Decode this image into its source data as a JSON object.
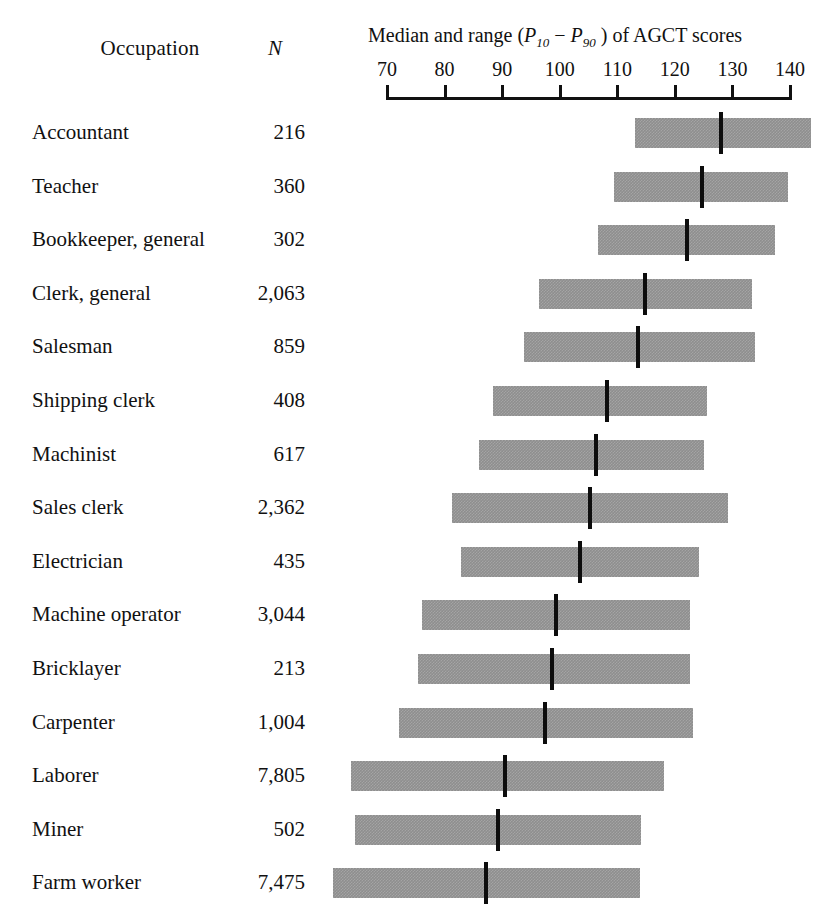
{
  "header": {
    "occupation_label": "Occupation",
    "n_label": "N",
    "axis_title_prefix": "Median and range (",
    "axis_title_p10": "P",
    "axis_title_p10_sub": "10",
    "axis_title_dash": " − ",
    "axis_title_p90": "P",
    "axis_title_p90_sub": "90",
    "axis_title_suffix": " ) of AGCT scores",
    "axis_title_full": "Median and range (P10 − P90 ) of AGCT scores"
  },
  "chart_data": {
    "type": "bar",
    "title": "Median and range (P10 − P90 ) of AGCT scores",
    "xlabel": "AGCT score",
    "ylabel": "Occupation",
    "xlim": [
      70,
      140
    ],
    "xticks": [
      70,
      80,
      90,
      100,
      110,
      120,
      130,
      140
    ],
    "grid": false,
    "legend": null,
    "columns": [
      "Occupation",
      "N",
      "P10",
      "Median",
      "P90"
    ],
    "categories": [
      "Accountant",
      "Teacher",
      "Bookkeeper, general",
      "Clerk, general",
      "Salesman",
      "Shipping clerk",
      "Machinist",
      "Sales clerk",
      "Electrician",
      "Machine operator",
      "Bricklayer",
      "Carpenter",
      "Laborer",
      "Miner",
      "Farm worker"
    ],
    "n_values": [
      "216",
      "360",
      "302",
      "2,063",
      "859",
      "408",
      "617",
      "2,362",
      "435",
      "3,044",
      "213",
      "1,004",
      "7,805",
      "502",
      "7,475"
    ],
    "rows": [
      {
        "occupation": "Accountant",
        "n": "216",
        "p10": 113.0,
        "median": 128.1,
        "p90": 143.7
      },
      {
        "occupation": "Teacher",
        "n": "360",
        "p10": 109.4,
        "median": 124.7,
        "p90": 139.7
      },
      {
        "occupation": "Bookkeeper, general",
        "n": "302",
        "p10": 106.7,
        "median": 122.1,
        "p90": 137.4
      },
      {
        "occupation": "Clerk, general",
        "n": "2,063",
        "p10": 96.4,
        "median": 114.8,
        "p90": 133.4
      },
      {
        "occupation": "Salesman",
        "n": "859",
        "p10": 93.8,
        "median": 113.6,
        "p90": 133.9
      },
      {
        "occupation": "Shipping clerk",
        "n": "408",
        "p10": 88.4,
        "median": 108.2,
        "p90": 125.6
      },
      {
        "occupation": "Machinist",
        "n": "617",
        "p10": 86.0,
        "median": 106.3,
        "p90": 125.1
      },
      {
        "occupation": "Sales clerk",
        "n": "2,362",
        "p10": 81.3,
        "median": 105.3,
        "p90": 129.2
      },
      {
        "occupation": "Electrician",
        "n": "435",
        "p10": 82.9,
        "median": 103.5,
        "p90": 124.2
      },
      {
        "occupation": "Machine operator",
        "n": "3,044",
        "p10": 76.1,
        "median": 99.4,
        "p90": 122.6
      },
      {
        "occupation": "Bricklayer",
        "n": "213",
        "p10": 75.4,
        "median": 98.7,
        "p90": 122.6
      },
      {
        "occupation": "Carpenter",
        "n": "1,004",
        "p10": 72.1,
        "median": 97.4,
        "p90": 123.1
      },
      {
        "occupation": "Laborer",
        "n": "7,805",
        "p10": 63.7,
        "median": 90.5,
        "p90": 118.1
      },
      {
        "occupation": "Miner",
        "n": "502",
        "p10": 64.5,
        "median": 89.3,
        "p90": 114.1
      },
      {
        "occupation": "Farm worker",
        "n": "7,475",
        "p10": 60.7,
        "median": 87.2,
        "p90": 113.9
      }
    ]
  },
  "style": {
    "bar_color": "#8e8e8e",
    "median_color": "#0d0d0d",
    "axis_color": "#111111",
    "background": "#ffffff"
  },
  "geometry": {
    "axis_x70_px": 387,
    "axis_x140_px": 790,
    "first_row_bar_top_px": 118,
    "row_pitch_px": 53.6,
    "bar_height_px": 30,
    "median_height_px": 42
  }
}
